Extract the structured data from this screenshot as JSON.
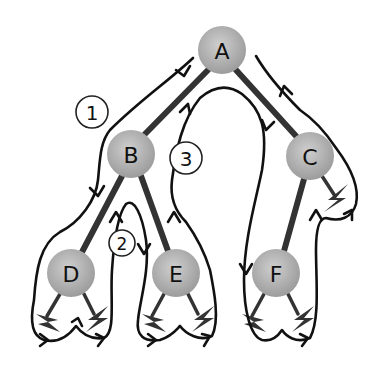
{
  "diagram": {
    "colors": {
      "node_fill_center": "#c8c8c8",
      "node_fill_edge": "#9a9a9a",
      "edge": "#333333",
      "path": "#111111",
      "background": "#ffffff"
    },
    "nodes": [
      {
        "id": "A",
        "label": "A",
        "cx": 222,
        "cy": 50,
        "r": 24
      },
      {
        "id": "B",
        "label": "B",
        "cx": 131,
        "cy": 154,
        "r": 24
      },
      {
        "id": "C",
        "label": "C",
        "cx": 310,
        "cy": 156,
        "r": 24
      },
      {
        "id": "D",
        "label": "D",
        "cx": 71,
        "cy": 273,
        "r": 24
      },
      {
        "id": "E",
        "label": "E",
        "cx": 176,
        "cy": 273,
        "r": 24
      },
      {
        "id": "F",
        "label": "F",
        "cx": 276,
        "cy": 273,
        "r": 24
      }
    ],
    "edges": [
      {
        "from": "A",
        "to": "B"
      },
      {
        "from": "A",
        "to": "C"
      },
      {
        "from": "B",
        "to": "D"
      },
      {
        "from": "B",
        "to": "E"
      },
      {
        "from": "C",
        "to": "F"
      }
    ],
    "null_children": [
      {
        "parent": "C",
        "side": "right"
      },
      {
        "parent": "D",
        "side": "left"
      },
      {
        "parent": "D",
        "side": "right"
      },
      {
        "parent": "E",
        "side": "left"
      },
      {
        "parent": "E",
        "side": "right"
      },
      {
        "parent": "F",
        "side": "left"
      },
      {
        "parent": "F",
        "side": "right"
      }
    ],
    "step_markers": [
      {
        "label": "1",
        "cx": 92,
        "cy": 112,
        "r": 16
      },
      {
        "label": "2",
        "cx": 122,
        "cy": 243,
        "r": 13
      },
      {
        "label": "3",
        "cx": 186,
        "cy": 158,
        "r": 16
      }
    ]
  }
}
